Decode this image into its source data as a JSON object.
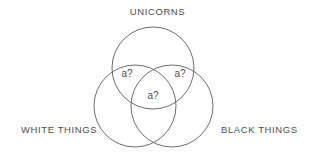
{
  "diagram": {
    "type": "venn",
    "background_color": "#ffffff",
    "stroke_color": "#6e6e6e",
    "text_color": "#4d4d4d",
    "sets": [
      {
        "id": "unicorns",
        "label": "UNICORNS",
        "label_position": "top-center",
        "cx": 153,
        "cy": 68,
        "r": 41
      },
      {
        "id": "white-things",
        "label": "WHITE THINGS",
        "label_position": "bottom-left",
        "cx": 135,
        "cy": 106,
        "r": 41
      },
      {
        "id": "black-things",
        "label": "BLACK THINGS",
        "label_position": "bottom-right",
        "cx": 172,
        "cy": 106,
        "r": 41
      }
    ],
    "regions": [
      {
        "id": "unicorns-white",
        "label": "a?",
        "sets": [
          "unicorns",
          "white-things"
        ]
      },
      {
        "id": "unicorns-black",
        "label": "a?",
        "sets": [
          "unicorns",
          "black-things"
        ]
      },
      {
        "id": "unicorns-white-black",
        "label": "a?",
        "sets": [
          "unicorns",
          "white-things",
          "black-things"
        ]
      }
    ]
  }
}
